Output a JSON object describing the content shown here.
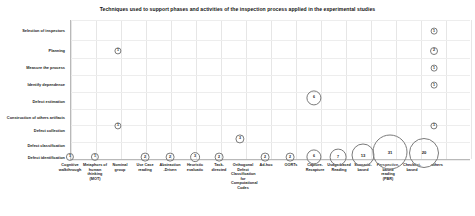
{
  "chart_data": {
    "type": "scatter",
    "title": "Techniques used to support phases and activities of the inspection process applied in the experimental studies",
    "xlabel": "",
    "ylabel": "",
    "grid": true,
    "legend": "none",
    "categories_x": [
      "Cognitive walkthrough",
      "Metaphors of human thinking (MOT)",
      "Nominal group",
      "Use Case reading",
      "Abstraction-Driven",
      "Heuristic evaluatic",
      "Task-directed",
      "Orthogonal Defect Classification for Computational Codes",
      "Ad-hoc",
      "OORTs",
      "Capture-Recapture",
      "Usage-based Reading",
      "Scenario-based",
      "Perspective-based reading (PBR)",
      "Checklist-based",
      "others"
    ],
    "categories_y": [
      "Selection of inspectors",
      "Planning",
      "Measure the process",
      "Identify dependence",
      "Defect estimation",
      "Construction of others artifacts",
      "Defect collection",
      "Defect classification",
      "Defect identification"
    ],
    "points": [
      {
        "x": "others",
        "y": "Selection of inspectors",
        "value": 1
      },
      {
        "x": "Metaphors of human thinking (MOT)",
        "y": "Planning",
        "value": 1
      },
      {
        "x": "others",
        "y": "Planning",
        "value": 2
      },
      {
        "x": "others",
        "y": "Measure the process",
        "value": 1
      },
      {
        "x": "others",
        "y": "Identify dependence",
        "value": 1
      },
      {
        "x": "Capture-Recapture",
        "y": "Defect estimation",
        "value": 6
      },
      {
        "x": "Metaphors of human thinking (MOT)",
        "y": "Construction of others artifacts",
        "value": 1
      },
      {
        "x": "others",
        "y": "Defect collection",
        "value": 1
      },
      {
        "x": "Orthogonal Defect Classification for Computational Codes",
        "y": "Defect classification",
        "value": 3
      },
      {
        "x": "Cognitive walkthrough",
        "y": "Defect identification",
        "value": 1
      },
      {
        "x": "Metaphors of human thinking (MOT)",
        "y": "Defect identification",
        "value": 1
      },
      {
        "x": "Use Case reading",
        "y": "Defect identification",
        "value": 2
      },
      {
        "x": "Abstraction-Driven",
        "y": "Defect identification",
        "value": 2
      },
      {
        "x": "Heuristic evaluatic",
        "y": "Defect identification",
        "value": 3
      },
      {
        "x": "Task-directed",
        "y": "Defect identification",
        "value": 2
      },
      {
        "x": "Ad-hoc",
        "y": "Defect identification",
        "value": 2
      },
      {
        "x": "OORTs",
        "y": "Defect identification",
        "value": 2
      },
      {
        "x": "Capture-Recapture",
        "y": "Defect identification",
        "value": 6
      },
      {
        "x": "Usage-based Reading",
        "y": "Defect identification",
        "value": 7
      },
      {
        "x": "Scenario-based",
        "y": "Defect identification",
        "value": 13
      },
      {
        "x": "Perspective-based reading (PBR)",
        "y": "Defect identification",
        "value": 31
      },
      {
        "x": "Checklist-based",
        "y": "Defect identification",
        "value": 20
      }
    ]
  },
  "bubbles": [
    {
      "name": "bubble-others-selection-inspectors",
      "cx": 434,
      "cy": 31,
      "r": 3.4,
      "label": "1"
    },
    {
      "name": "bubble-mot-planning",
      "cx": 118,
      "cy": 51,
      "r": 3.6,
      "label": "1"
    },
    {
      "name": "bubble-others-planning",
      "cx": 434,
      "cy": 51,
      "r": 4.0,
      "label": "2"
    },
    {
      "name": "bubble-others-measure-process",
      "cx": 434,
      "cy": 68,
      "r": 3.4,
      "label": "1"
    },
    {
      "name": "bubble-others-identify-dependence",
      "cx": 434,
      "cy": 85,
      "r": 3.4,
      "label": "1"
    },
    {
      "name": "bubble-capture-recapture-defect-estimation",
      "cx": 314,
      "cy": 98,
      "r": 7.6,
      "label": "6"
    },
    {
      "name": "bubble-mot-construction-others-artifacts",
      "cx": 118,
      "cy": 126,
      "r": 3.6,
      "label": "1"
    },
    {
      "name": "bubble-others-defect-collection",
      "cx": 434,
      "cy": 126,
      "r": 3.6,
      "label": "1"
    },
    {
      "name": "bubble-odc-defect-classification",
      "cx": 240,
      "cy": 139,
      "r": 4.6,
      "label": "3"
    },
    {
      "name": "bubble-cognitive-walkthrough-defect-identification",
      "cx": 70,
      "cy": 157,
      "r": 4.1,
      "label": "1"
    },
    {
      "name": "bubble-mot-defect-identification",
      "cx": 95,
      "cy": 157,
      "r": 4.1,
      "label": "1"
    },
    {
      "name": "bubble-usecase-reading-defect-identification",
      "cx": 145,
      "cy": 157,
      "r": 4.4,
      "label": "2"
    },
    {
      "name": "bubble-abstraction-driven-defect-identification",
      "cx": 170,
      "cy": 157,
      "r": 4.4,
      "label": "2"
    },
    {
      "name": "bubble-heuristic-evaluation-defect-identification",
      "cx": 195,
      "cy": 157,
      "r": 4.9,
      "label": "3"
    },
    {
      "name": "bubble-task-directed-defect-identification",
      "cx": 219,
      "cy": 157,
      "r": 4.4,
      "label": "2"
    },
    {
      "name": "bubble-adhoc-defect-identification",
      "cx": 265,
      "cy": 157,
      "r": 4.4,
      "label": "2"
    },
    {
      "name": "bubble-oorts-defect-identification",
      "cx": 290,
      "cy": 157,
      "r": 4.4,
      "label": "2"
    },
    {
      "name": "bubble-capture-recapture-defect-identification",
      "cx": 314,
      "cy": 157,
      "r": 7.6,
      "label": "6"
    },
    {
      "name": "bubble-usage-based-reading-defect-identification",
      "cx": 338,
      "cy": 157,
      "r": 8.4,
      "label": "7"
    },
    {
      "name": "bubble-scenario-based-defect-identification",
      "cx": 363,
      "cy": 155,
      "r": 11.5,
      "label": "13"
    },
    {
      "name": "bubble-pbr-defect-identification",
      "cx": 390,
      "cy": 152,
      "r": 17.5,
      "label": "31"
    },
    {
      "name": "bubble-checklist-based-defect-identification",
      "cx": 424,
      "cy": 153,
      "r": 15.0,
      "label": "20"
    }
  ],
  "y_axis": {
    "labels": [
      {
        "name": "y-label-selection-of-inspectors",
        "text": "Selection of inspectors",
        "cy": 31
      },
      {
        "name": "y-label-planning",
        "text": "Planning",
        "cy": 51
      },
      {
        "name": "y-label-measure-the-process",
        "text": "Measure the process",
        "cy": 68
      },
      {
        "name": "y-label-identify-dependence",
        "text": "Identify dependence",
        "cy": 85
      },
      {
        "name": "y-label-defect-estimation",
        "text": "Defect estimation",
        "cy": 102
      },
      {
        "name": "y-label-construction-of-others-artifacts",
        "text": "Construction of others artifacts",
        "cy": 118
      },
      {
        "name": "y-label-defect-collection",
        "text": "Defect collection",
        "cy": 131
      },
      {
        "name": "y-label-defect-classification",
        "text": "Defect classification",
        "cy": 146
      },
      {
        "name": "y-label-defect-identification",
        "text": "Defect identification",
        "cy": 158
      }
    ]
  },
  "x_axis": {
    "labels": [
      {
        "name": "x-label-cognitive-walkthrough",
        "text": "Cognitive walkthrough",
        "cx": 70,
        "w": 24
      },
      {
        "name": "x-label-metaphors-of-human-thinking",
        "text": "Metaphors of human thinking (MOT)",
        "cx": 95,
        "w": 24
      },
      {
        "name": "x-label-nominal-group",
        "text": "Nominal group",
        "cx": 120,
        "w": 22
      },
      {
        "name": "x-label-use-case-reading",
        "text": "Use Case reading",
        "cx": 145,
        "w": 22
      },
      {
        "name": "x-label-abstraction-driven",
        "text": "Abstraction -Driven",
        "cx": 170,
        "w": 23
      },
      {
        "name": "x-label-heuristic-evaluatic",
        "text": "Heuristic evaluatic",
        "cx": 195,
        "w": 22
      },
      {
        "name": "x-label-task-directed",
        "text": "Task- directed",
        "cx": 219,
        "w": 20
      },
      {
        "name": "x-label-orthogonal-defect-classification",
        "text": "Orthogonal Defect Classification for Computational Codes",
        "cx": 243,
        "w": 24
      },
      {
        "name": "x-label-ad-hoc",
        "text": "Ad-hoc",
        "cx": 266,
        "w": 20
      },
      {
        "name": "x-label-oorts",
        "text": "OORTs",
        "cx": 291,
        "w": 20
      },
      {
        "name": "x-label-capture-recapture",
        "text": "Capture- Recapture",
        "cx": 315,
        "w": 23
      },
      {
        "name": "x-label-usage-based-reading",
        "text": "Usage-based Reading",
        "cx": 339,
        "w": 24
      },
      {
        "name": "x-label-scenario-based",
        "text": "Scenario- based",
        "cx": 363,
        "w": 21
      },
      {
        "name": "x-label-perspective-based-reading",
        "text": "Perspective- based reading (PBR)",
        "cx": 388,
        "w": 23
      },
      {
        "name": "x-label-checklist-based",
        "text": "Checklist- based",
        "cx": 412,
        "w": 21
      },
      {
        "name": "x-label-others",
        "text": "others",
        "cx": 437,
        "w": 20
      }
    ]
  },
  "gridlines": {
    "vertical_x": [
      0,
      25,
      50,
      75,
      100,
      125,
      150,
      175,
      200,
      225,
      250,
      275,
      300,
      325,
      350,
      375,
      400
    ],
    "horizontal_y": [
      0,
      20,
      38,
      55,
      72,
      89,
      105,
      122,
      140
    ]
  }
}
